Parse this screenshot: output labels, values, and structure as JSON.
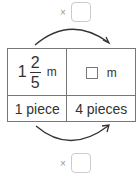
{
  "top_operation": {
    "symbol": "×",
    "answer": ""
  },
  "bottom_operation": {
    "symbol": "×",
    "answer": ""
  },
  "table": {
    "row1": {
      "left": {
        "whole": "1",
        "numerator": "2",
        "denominator": "5",
        "unit": "m"
      },
      "right": {
        "blank": "",
        "unit": "m"
      }
    },
    "row2": {
      "left": "1 piece",
      "right": "4 pieces"
    }
  },
  "colors": {
    "line": "#777777",
    "arrow": "#333333",
    "box_border": "#cccccc",
    "times": "#999999"
  }
}
